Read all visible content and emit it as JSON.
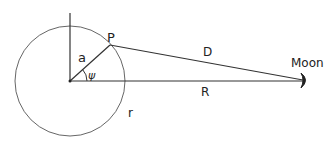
{
  "figure": {
    "type": "geometry diagram"
  },
  "labels": {
    "point_p": "P",
    "earth_radius": "a",
    "angle": "ψ",
    "distance_observer_moon": "D",
    "distance_center_moon": "R",
    "circle_label": "r",
    "moon": "Moon"
  },
  "geometry": {
    "center": [
      70,
      81
    ],
    "circle_radius": 55,
    "point_p": [
      110,
      45
    ],
    "moon_position": [
      303,
      80
    ],
    "vertical_axis_top": [
      70,
      13
    ],
    "line_color": "#333333",
    "circle_color": "#555555"
  }
}
